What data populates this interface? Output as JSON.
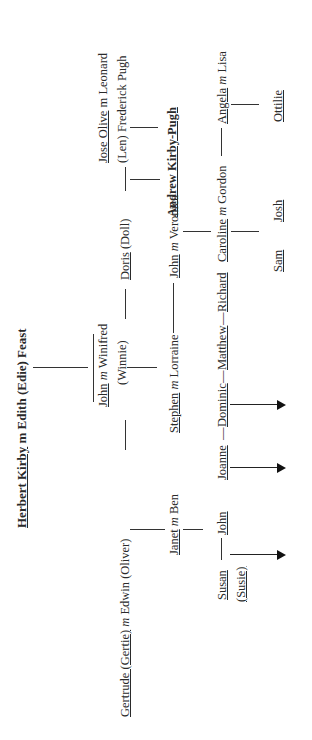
{
  "title": {
    "name1": "Herbert Kirby",
    "m": "m",
    "name2": "Edith (Edie) Feast"
  },
  "gen1": {
    "gertrude": {
      "name": "Gertrude (Gertie)",
      "m": "m",
      "spouse": "Edwin (Oliver)"
    },
    "john": {
      "name": "John",
      "m": "m",
      "spouse": "Winifred",
      "spouse_nick": "(Winnie)"
    },
    "doris": {
      "name": "Doris",
      "nick": "(Doll)"
    },
    "jose": {
      "name": "Jose Olive",
      "m": "m",
      "spouse": "Leonard",
      "spouse_line2": "(Len) Frederick Pugh"
    }
  },
  "gen2": {
    "janet": {
      "name": "Janet",
      "m": "m",
      "spouse": "Ben"
    },
    "stephen": {
      "name": "Stephen",
      "m": "m",
      "spouse": "Lorraine"
    },
    "john": {
      "name": "John",
      "m": "m",
      "spouse": "Veronica"
    },
    "andrew": {
      "name": "Andrew Kirby-Pugh"
    }
  },
  "gen3": {
    "susan": {
      "name": "Susan",
      "nick": "(Susie)"
    },
    "john": {
      "name": "John"
    },
    "joanne": {
      "name": "Joanne"
    },
    "dominic": {
      "name": "Dominic"
    },
    "matthew": {
      "name": "Matthew"
    },
    "richard": {
      "name": "Richard"
    },
    "caroline": {
      "name": "Caroline",
      "m": "m",
      "spouse": "Gordon"
    },
    "angela": {
      "name": "Angela",
      "m": "m",
      "spouse": "Lisa"
    }
  },
  "gen4": {
    "sam": {
      "name": "Sam"
    },
    "josh": {
      "name": "Josh"
    },
    "ottilie": {
      "name": "Ottilie"
    }
  },
  "dash": "—"
}
